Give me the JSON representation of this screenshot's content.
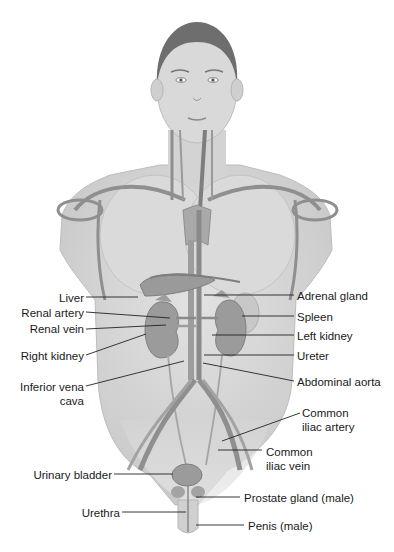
{
  "figure": {
    "colors": {
      "skin": "#d6d6d6",
      "skin_edge": "#bdbdbd",
      "vessel": "#8f8f8f",
      "organ": "#9a9a9a",
      "hair": "#6e6e6e",
      "leader_line": "#222222",
      "text": "#1a1a1a"
    }
  },
  "labels_left": [
    {
      "id": "liver",
      "text": "Liver",
      "x": 84,
      "y": 291
    },
    {
      "id": "renal-artery",
      "text": "Renal artery",
      "x": 84,
      "y": 306
    },
    {
      "id": "renal-vein",
      "text": "Renal vein",
      "x": 84,
      "y": 323
    },
    {
      "id": "right-kidney",
      "text": "Right kidney",
      "x": 84,
      "y": 349
    },
    {
      "id": "inferior-vena-cava",
      "text": "Inferior vena",
      "text2": "cava",
      "x": 84,
      "y": 380
    },
    {
      "id": "urinary-bladder",
      "text": "Urinary bladder",
      "x": 112,
      "y": 468
    },
    {
      "id": "urethra",
      "text": "Urethra",
      "x": 120,
      "y": 506
    }
  ],
  "labels_right": [
    {
      "id": "adrenal-gland",
      "text": "Adrenal gland",
      "x": 297,
      "y": 290
    },
    {
      "id": "spleen",
      "text": "Spleen",
      "x": 297,
      "y": 311
    },
    {
      "id": "left-kidney",
      "text": "Left kidney",
      "x": 297,
      "y": 330
    },
    {
      "id": "ureter",
      "text": "Ureter",
      "x": 297,
      "y": 350
    },
    {
      "id": "abdominal-aorta",
      "text": "Abdominal aorta",
      "x": 297,
      "y": 376
    },
    {
      "id": "common-iliac-artery",
      "text": "Common",
      "text2": "iliac artery",
      "x": 302,
      "y": 407
    },
    {
      "id": "common-iliac-vein",
      "text": "Common",
      "text2": "iliac vein",
      "x": 266,
      "y": 446
    },
    {
      "id": "prostate-gland",
      "text": "Prostate gland (male)",
      "x": 244,
      "y": 492
    },
    {
      "id": "penis",
      "text": "Penis (male)",
      "x": 248,
      "y": 520
    }
  ]
}
